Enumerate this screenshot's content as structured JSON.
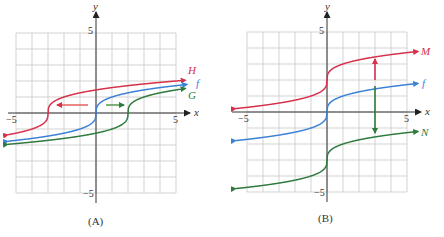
{
  "chart_data": [
    {
      "type": "line",
      "panel": "(A)",
      "caption": "(A)",
      "xlabel": "x",
      "ylabel": "y",
      "xlim": [
        -5.5,
        5.5
      ],
      "ylim": [
        -5,
        5
      ],
      "grid": true,
      "x_ticks": [
        "-5",
        "5"
      ],
      "y_ticks": [
        "5",
        "-5"
      ],
      "series": [
        {
          "name": "H",
          "color": "#d6304a",
          "expression": "cbrt(x + 3)",
          "x": [
            -5.5,
            -4,
            -3,
            -2,
            0,
            2,
            5.5
          ],
          "values": [
            -1.36,
            -1.0,
            0.0,
            1.0,
            1.44,
            1.71,
            2.02
          ]
        },
        {
          "name": "f",
          "color": "#3b82d6",
          "expression": "cbrt(x)",
          "x": [
            -5.5,
            -3,
            -1,
            0,
            1,
            3,
            5.5
          ],
          "values": [
            -1.77,
            -1.44,
            -1.0,
            0.0,
            1.0,
            1.44,
            1.77
          ]
        },
        {
          "name": "G",
          "color": "#2f7a3e",
          "expression": "cbrt(x - 2)",
          "x": [
            -5.5,
            -2,
            1,
            2,
            3,
            5.5
          ],
          "values": [
            -1.96,
            -1.59,
            -1.0,
            0.0,
            1.0,
            1.52
          ]
        }
      ],
      "annotations": [
        {
          "type": "arrow",
          "color": "#d6304a",
          "direction": "left",
          "from": [
            -0.6,
            0.5
          ],
          "to": [
            -2.4,
            0.5
          ]
        },
        {
          "type": "arrow",
          "color": "#2f7a3e",
          "direction": "right",
          "from": [
            0.6,
            0.5
          ],
          "to": [
            1.7,
            0.5
          ]
        }
      ]
    },
    {
      "type": "line",
      "panel": "(B)",
      "caption": "(B)",
      "xlabel": "x",
      "ylabel": "y",
      "xlim": [
        -5.5,
        5.5
      ],
      "ylim": [
        -5,
        5
      ],
      "grid": true,
      "x_ticks": [
        "-5",
        "5"
      ],
      "y_ticks": [
        "5",
        "-5"
      ],
      "series": [
        {
          "name": "M",
          "color": "#d6304a",
          "expression": "cbrt(x) + 2",
          "x": [
            -5.5,
            -3,
            -1,
            0,
            1,
            3,
            5.5
          ],
          "values": [
            0.23,
            0.56,
            1.0,
            2.0,
            3.0,
            3.44,
            3.77
          ]
        },
        {
          "name": "f",
          "color": "#3b82d6",
          "expression": "cbrt(x)",
          "x": [
            -5.5,
            -3,
            -1,
            0,
            1,
            3,
            5.5
          ],
          "values": [
            -1.77,
            -1.44,
            -1.0,
            0.0,
            1.0,
            1.44,
            1.77
          ]
        },
        {
          "name": "N",
          "color": "#2f7a3e",
          "expression": "cbrt(x) - 3",
          "x": [
            -5.5,
            -3,
            -1,
            0,
            1,
            3,
            5.5
          ],
          "values": [
            -4.77,
            -4.44,
            -4.0,
            -3.0,
            -2.0,
            -1.56,
            -1.23
          ]
        }
      ],
      "annotations": [
        {
          "type": "arrow",
          "color": "#d6304a",
          "direction": "up",
          "x": 3,
          "from": 2.2,
          "to": 3.3
        },
        {
          "type": "arrow",
          "color": "#2f7a3e",
          "direction": "down",
          "x": 3,
          "from": 0.2,
          "to": -1.3
        }
      ]
    }
  ],
  "labels": {
    "a": {
      "caption": "(A)",
      "x_axis": "x",
      "y_axis": "y",
      "tick_xneg": "−5",
      "tick_xpos": "5",
      "tick_ypos": "5",
      "tick_yneg": "−5",
      "H": "H",
      "f": "f",
      "G": "G"
    },
    "b": {
      "caption": "(B)",
      "x_axis": "x",
      "y_axis": "y",
      "tick_xneg": "−5",
      "tick_xpos": "5",
      "tick_ypos": "5",
      "tick_yneg": "−5",
      "M": "M",
      "f": "f",
      "N": "N"
    }
  }
}
